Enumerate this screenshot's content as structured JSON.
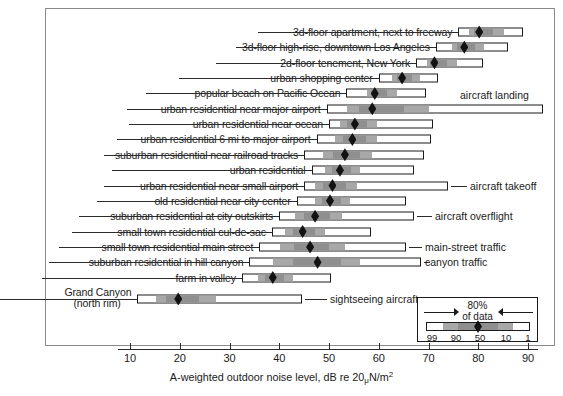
{
  "chart_data": {
    "type": "bar",
    "title": "",
    "xlabel": "A-weighted outdoor noise level, dB re 20 µN/m2",
    "xlabel_parts": {
      "main": "A-weighted outdoor noise level, dB re 20",
      "mu": "μ",
      "unit": "N/m",
      "exp": "2"
    },
    "ylabel": "",
    "xlim": [
      6,
      94
    ],
    "ticks": [
      10,
      20,
      30,
      40,
      50,
      60,
      70,
      80,
      90
    ],
    "ticklabels": [
      "10",
      "20",
      "30",
      "40",
      "50",
      "60",
      "70",
      "80",
      "90"
    ],
    "grid": false,
    "percentile_scheme": [
      "99",
      "90",
      "50",
      "10",
      "1"
    ],
    "categories": [
      "3d-floor apartment, next to freeway",
      "3d-floor high-rise, downtown Los Angeles",
      "2d-floor tenement, New York",
      "urban shopping center",
      "popular beach on Pacific Ocean",
      "urban residential near major airport",
      "urban residential near ocean",
      "urban residential 6 mi to major airport",
      "suburban residential near railroad tracks",
      "urban residential",
      "urban residential near small airport",
      "old residential near city center",
      "suburban residential at city outskirts",
      "small town residential cul-de-sac",
      "small town residential main street",
      "suburban residential in hill canyon",
      "farm in valley",
      "Grand Canyon"
    ],
    "rows": [
      {
        "label": "3d-floor apartment, next to freeway",
        "label2": "",
        "p99": 76.0,
        "p90": 78.0,
        "p50": 80.0,
        "p10": 85.0,
        "p1": 89.0,
        "annotation": ""
      },
      {
        "label": "3d-floor high-rise, downtown Los Angeles",
        "label2": "",
        "p99": 71.5,
        "p90": 74.5,
        "p50": 77.0,
        "p10": 81.0,
        "p1": 86.0,
        "annotation": ""
      },
      {
        "label": "2d-floor tenement, New York",
        "label2": "",
        "p99": 67.5,
        "p90": 69.5,
        "p50": 71.0,
        "p10": 75.5,
        "p1": 81.0,
        "annotation": ""
      },
      {
        "label": "urban shopping center",
        "label2": "",
        "p99": 60.0,
        "p90": 62.5,
        "p50": 64.5,
        "p10": 68.0,
        "p1": 72.0,
        "annotation": ""
      },
      {
        "label": "popular beach on Pacific Ocean",
        "label2": "",
        "p99": 53.5,
        "p90": 57.5,
        "p50": 59.0,
        "p10": 63.5,
        "p1": 69.5,
        "annotation": ""
      },
      {
        "label": "urban residential near major airport",
        "label2": "",
        "p99": 49.5,
        "p90": 53.5,
        "p50": 58.5,
        "p10": 70.0,
        "p1": 93.0,
        "annotation": "aircraft landing"
      },
      {
        "label": "urban residential near ocean",
        "label2": "",
        "p99": 50.0,
        "p90": 52.0,
        "p50": 55.0,
        "p10": 59.5,
        "p1": 71.0,
        "annotation": ""
      },
      {
        "label": "urban residential 6 mi to major airport",
        "label2": "",
        "p99": 47.5,
        "p90": 51.0,
        "p50": 54.5,
        "p10": 59.5,
        "p1": 70.5,
        "annotation": ""
      },
      {
        "label": "suburban residential near railroad tracks",
        "label2": "",
        "p99": 45.0,
        "p90": 48.5,
        "p50": 53.0,
        "p10": 58.5,
        "p1": 69.0,
        "annotation": ""
      },
      {
        "label": "urban residential",
        "label2": "",
        "p99": 46.5,
        "p90": 49.0,
        "p50": 52.0,
        "p10": 56.0,
        "p1": 67.0,
        "annotation": ""
      },
      {
        "label": "urban residential near small airport",
        "label2": "",
        "p99": 45.0,
        "p90": 47.0,
        "p50": 50.5,
        "p10": 55.5,
        "p1": 74.0,
        "annotation": "aircraft takeoff"
      },
      {
        "label": "old residential near city center",
        "label2": "",
        "p99": 43.5,
        "p90": 47.0,
        "p50": 50.0,
        "p10": 54.0,
        "p1": 65.5,
        "annotation": ""
      },
      {
        "label": "suburban residential at city outskirts",
        "label2": "",
        "p99": 40.0,
        "p90": 43.0,
        "p50": 47.0,
        "p10": 52.5,
        "p1": 67.0,
        "annotation": "aircraft overflight"
      },
      {
        "label": "small town residential cul-de-sac",
        "label2": "",
        "p99": 38.5,
        "p90": 41.0,
        "p50": 44.5,
        "p10": 49.0,
        "p1": 58.5,
        "annotation": ""
      },
      {
        "label": "small town residential main street",
        "label2": "",
        "p99": 36.0,
        "p90": 40.0,
        "p50": 46.0,
        "p10": 53.0,
        "p1": 65.5,
        "annotation": "main-street traffic"
      },
      {
        "label": "suburban residential in hill canyon",
        "label2": "",
        "p99": 34.0,
        "p90": 38.5,
        "p50": 47.5,
        "p10": 56.0,
        "p1": 68.5,
        "annotation": "canyon traffic"
      },
      {
        "label": "farm in valley",
        "label2": "",
        "p99": 32.5,
        "p90": 35.5,
        "p50": 38.5,
        "p10": 42.5,
        "p1": 50.5,
        "annotation": ""
      },
      {
        "label": "Grand Canyon",
        "label2": "(north rim)",
        "p99": 11.5,
        "p90": 15.0,
        "p50": 19.5,
        "p10": 27.0,
        "p1": 44.5,
        "annotation": "sightseeing aircraft"
      }
    ]
  },
  "legend": {
    "title_line1": "80%",
    "title_line2": "of data",
    "numbers": [
      "99",
      "90",
      "50",
      "10",
      "1"
    ]
  },
  "colors": {
    "bar_outline": "#1b1b1b",
    "band_mid": "#a8a8a8",
    "band_dark": "#8f8f8f",
    "median_marker": "#121212",
    "frame": "#8a8a8a"
  }
}
